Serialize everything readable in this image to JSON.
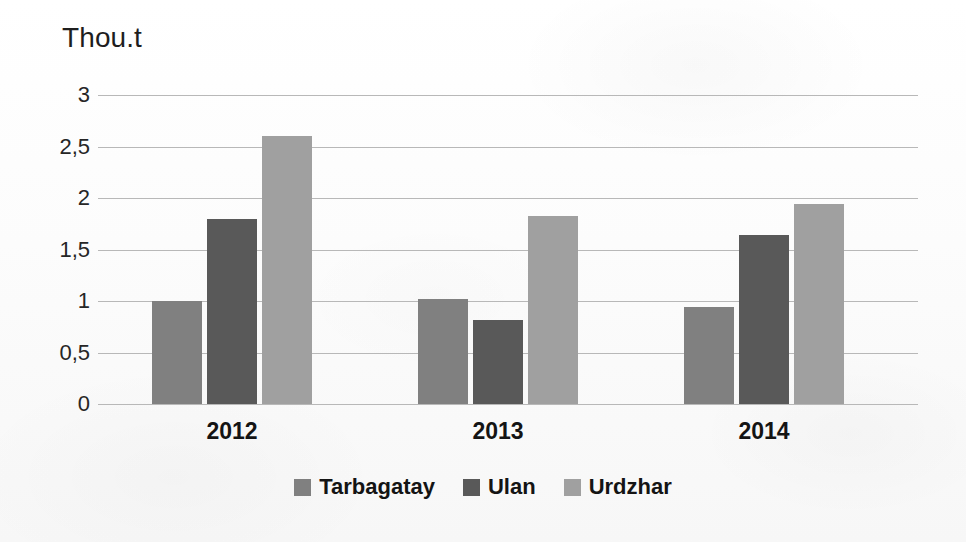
{
  "chart_data": {
    "type": "bar",
    "title": "",
    "ylabel": "Thou.t",
    "xlabel": "",
    "categories": [
      "2012",
      "2013",
      "2014"
    ],
    "series": [
      {
        "name": "Tarbagatay",
        "color": "#808080",
        "values": [
          1.0,
          1.02,
          0.94
        ]
      },
      {
        "name": "Ulan",
        "color": "#595959",
        "values": [
          1.8,
          0.82,
          1.64
        ]
      },
      {
        "name": "Urdzhar",
        "color": "#a0a0a0",
        "values": [
          2.6,
          1.83,
          1.94
        ]
      }
    ],
    "ylim": [
      0,
      3
    ],
    "yticks": [
      0,
      0.5,
      1,
      1.5,
      2,
      2.5,
      3
    ],
    "ytick_labels": [
      "0",
      "0,5",
      "1",
      "1,5",
      "2",
      "2,5",
      "3"
    ],
    "grid": true,
    "legend_position": "bottom",
    "decimal_separator": ",",
    "gridline_color": "#b8b8b8",
    "background_color": "#fdfdfd"
  }
}
